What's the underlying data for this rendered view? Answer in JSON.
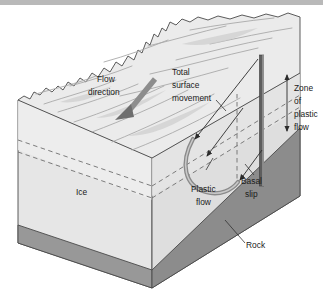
{
  "figure": {
    "type": "geology-block-diagram"
  },
  "top_bar": {
    "name": "page-header-rule",
    "color": "#b9b9b9"
  },
  "labels": {
    "flow_direction": {
      "line1": "Flow",
      "line2": "direction"
    },
    "total_surface_movement": {
      "line1": "Total",
      "line2": "surface",
      "line3": "movement"
    },
    "zone_of_plastic_flow": {
      "line1": "Zone",
      "line2": "of",
      "line3": "plastic",
      "line4": "flow"
    },
    "plastic_flow": {
      "line1": "Plastic",
      "line2": "flow"
    },
    "basal_slip": {
      "line1": "Basal",
      "line2": "slip"
    },
    "ice": "Ice",
    "rock": "Rock"
  },
  "colors": {
    "ice_top": "#ebebeb",
    "ice_left_face": "#e4e4e4",
    "ice_right_face": "#dcdcdc",
    "rock_left_face": "#969696",
    "rock_right_face": "#8a8a8a",
    "outline": "#4a4a4a",
    "borehole_dark": "#5a5a5a",
    "arrow_gray": "#8e8e8e",
    "dashed_line": "#6f6f6f",
    "text": "#1a1a1a",
    "background": "#ffffff"
  },
  "annotations": {
    "borehole_vertical": "original vertical borehole in ice",
    "borehole_deformed": "deformed borehole curve showing plastic flow",
    "zone_arrow": "double-headed vertical arrow marking zone of plastic flow",
    "flow_arrow": "thick gray arrow showing downslope flow direction",
    "basal_slip_arrow": "arrow at glacier base showing basal slip component",
    "surface_movement_arrow": "arrow showing total surface movement vector"
  }
}
